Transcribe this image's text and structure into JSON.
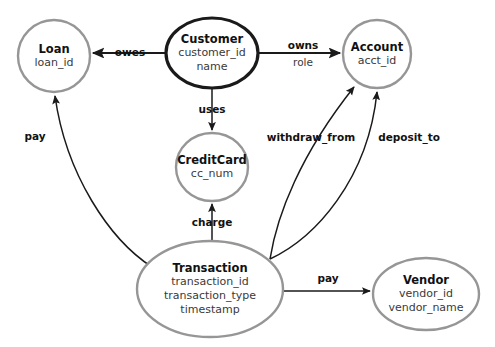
{
  "diagram": {
    "type": "entity-relationship-diagram",
    "canvas": {
      "width": 495,
      "height": 347,
      "background": "#ffffff"
    },
    "colors": {
      "normal_entity_border": "#969696",
      "strong_entity_border": "#1a1a1a",
      "edge": "#1a1a1a",
      "title_text": "#111111",
      "attribute_text": "#3a3a3a"
    },
    "entities": [
      {
        "id": "loan",
        "title": "Loan",
        "attributes": [
          "loan_id"
        ],
        "shape": "circle",
        "emphasis": "normal",
        "cx": 54,
        "cy": 56,
        "rx": 36,
        "ry": 36
      },
      {
        "id": "customer",
        "title": "Customer",
        "attributes": [
          "customer_id",
          "name"
        ],
        "shape": "ellipse",
        "emphasis": "strong",
        "cx": 212,
        "cy": 53,
        "rx": 46,
        "ry": 35
      },
      {
        "id": "account",
        "title": "Account",
        "attributes": [
          "acct_id"
        ],
        "shape": "circle",
        "emphasis": "normal",
        "cx": 377,
        "cy": 54,
        "rx": 34,
        "ry": 34
      },
      {
        "id": "creditcard",
        "title": "CreditCard",
        "attributes": [
          "cc_num"
        ],
        "shape": "circle",
        "emphasis": "normal",
        "cx": 212,
        "cy": 167,
        "rx": 36,
        "ry": 34
      },
      {
        "id": "transaction",
        "title": "Transaction",
        "attributes": [
          "transaction_id",
          "transaction_type",
          "timestamp"
        ],
        "shape": "ellipse",
        "emphasis": "normal",
        "cx": 210,
        "cy": 289,
        "rx": 73,
        "ry": 48
      },
      {
        "id": "vendor",
        "title": "Vendor",
        "attributes": [
          "vendor_id",
          "vendor_name"
        ],
        "shape": "ellipse",
        "emphasis": "normal",
        "cx": 426,
        "cy": 294,
        "rx": 53,
        "ry": 36
      }
    ],
    "relationships": [
      {
        "id": "owes",
        "label": "owes",
        "sublabel": "",
        "from": "customer",
        "to": "loan",
        "label_x": 130,
        "label_y": 53,
        "path": "M 166 53 L 93 53",
        "thick": true,
        "arrow": true
      },
      {
        "id": "owns",
        "label": "owns",
        "sublabel": "role",
        "from": "customer",
        "to": "account",
        "label_x": 303,
        "label_y": 46,
        "sublabel_x": 303,
        "sublabel_y": 63,
        "path": "M 258 53 L 340 53",
        "thick": true,
        "arrow": true
      },
      {
        "id": "uses",
        "label": "uses",
        "sublabel": "",
        "from": "customer",
        "to": "creditcard",
        "label_x": 212,
        "label_y": 110,
        "path": "M 212 88 L 212 130",
        "thick": false,
        "arrow": true
      },
      {
        "id": "charge",
        "label": "charge",
        "sublabel": "",
        "from": "transaction",
        "to": "creditcard",
        "label_x": 212,
        "label_y": 223,
        "path": "M 212 243 L 212 204",
        "thick": false,
        "arrow": true
      },
      {
        "id": "pay-loan",
        "label": "pay",
        "sublabel": "",
        "from": "transaction",
        "to": "loan",
        "label_x": 35,
        "label_y": 137,
        "path": "M 152 267 C 110 240 66 175 55 96",
        "thick": false,
        "arrow": true
      },
      {
        "id": "withdraw-from",
        "label": "withdraw_from",
        "sublabel": "",
        "from": "transaction",
        "to": "account",
        "label_x": 311,
        "label_y": 138,
        "path": "M 270 259 C 277 215 300 155 354 87",
        "thick": false,
        "arrow": true
      },
      {
        "id": "deposit-to",
        "label": "deposit_to",
        "sublabel": "",
        "from": "transaction",
        "to": "account",
        "label_x": 409,
        "label_y": 138,
        "path": "M 270 259 C 315 238 368 180 377 92",
        "thick": false,
        "arrow": true
      },
      {
        "id": "pay-vendor",
        "label": "pay",
        "sublabel": "",
        "from": "transaction",
        "to": "vendor",
        "label_x": 328,
        "label_y": 279,
        "path": "M 282 291 L 370 291",
        "thick": false,
        "arrow": true
      }
    ]
  }
}
